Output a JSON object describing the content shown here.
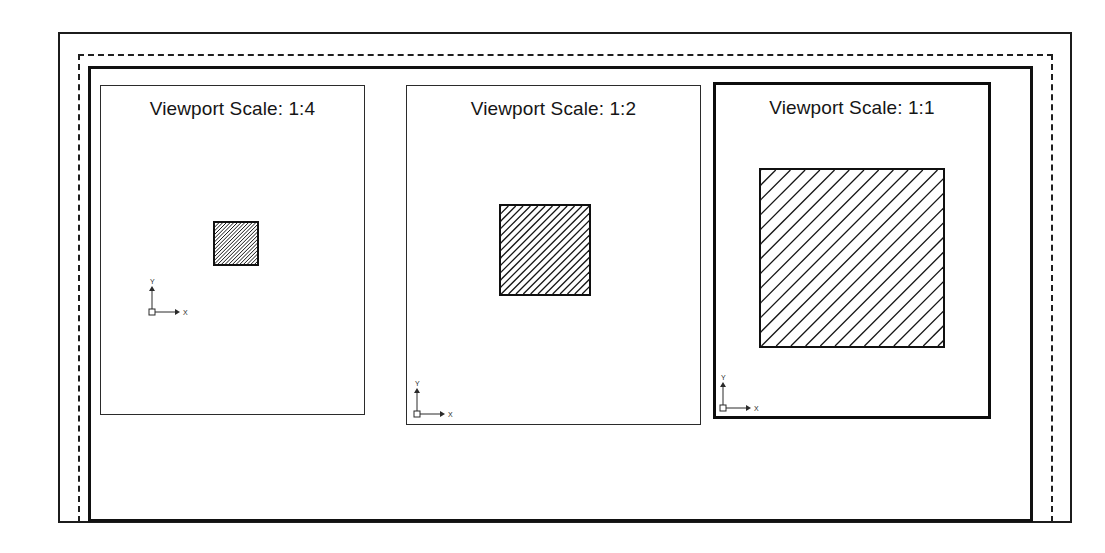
{
  "drawing": {
    "title": "Paper space layout with three scaled viewports",
    "background_color": "#ffffff",
    "line_color": "#1a1a1a"
  },
  "sheet": {
    "outer_border": {
      "name": "sheet-edge",
      "style": "solid",
      "width_px": 2
    },
    "margin_line": {
      "name": "printable-margin",
      "style": "dashed",
      "width_px": 2
    },
    "inner_border": {
      "name": "title-block-frame",
      "style": "solid",
      "width_px": 3
    }
  },
  "viewports": [
    {
      "id": "viewport-1",
      "label": "Viewport Scale: 1:4",
      "scale": "1:4",
      "scale_ratio": 0.25,
      "active": false,
      "border_style": "thin",
      "frame": {
        "x": 100,
        "y": 85,
        "w": 265,
        "h": 330
      },
      "object": {
        "name": "hatched-square",
        "x": 213,
        "y": 221,
        "w": 46,
        "h": 45,
        "hatch_pattern": "ANSI31",
        "hatch_angle_deg": 45,
        "hatch_spacing_px": 2.6
      },
      "ucs": {
        "x": 148,
        "y": 270,
        "size": 34,
        "x_label": "X",
        "y_label": "Y"
      }
    },
    {
      "id": "viewport-2",
      "label": "Viewport Scale: 1:2",
      "scale": "1:2",
      "scale_ratio": 0.5,
      "active": false,
      "border_style": "thin",
      "frame": {
        "x": 406,
        "y": 85,
        "w": 295,
        "h": 340
      },
      "object": {
        "name": "hatched-square",
        "x": 499,
        "y": 204,
        "w": 92,
        "h": 92,
        "hatch_pattern": "ANSI31",
        "hatch_angle_deg": 45,
        "hatch_spacing_px": 5.2
      },
      "ucs": {
        "x": 413,
        "y": 372,
        "size": 34,
        "x_label": "X",
        "y_label": "Y"
      }
    },
    {
      "id": "viewport-3",
      "label": "Viewport Scale: 1:1",
      "scale": "1:1",
      "scale_ratio": 1.0,
      "active": true,
      "border_style": "thick",
      "frame": {
        "x": 713,
        "y": 82,
        "w": 278,
        "h": 337
      },
      "object": {
        "name": "hatched-square",
        "x": 759,
        "y": 168,
        "w": 186,
        "h": 180,
        "hatch_pattern": "ANSI31",
        "hatch_angle_deg": 45,
        "hatch_spacing_px": 10.4
      },
      "ucs": {
        "x": 719,
        "y": 366,
        "size": 34,
        "x_label": "X",
        "y_label": "Y"
      }
    }
  ],
  "chart_data": {
    "type": "table",
    "columns": [
      "Viewport",
      "Scale",
      "Square size (px on sheet)",
      "Hatch spacing (px)",
      "Active"
    ],
    "rows": [
      [
        "Viewport Scale: 1:4",
        "1:4",
        "46 x 45",
        "2.6",
        "no"
      ],
      [
        "Viewport Scale: 1:2",
        "1:2",
        "92 x 92",
        "5.2",
        "no"
      ],
      [
        "Viewport Scale: 1:1",
        "1:1",
        "186 x 180",
        "10.4",
        "yes"
      ]
    ]
  }
}
